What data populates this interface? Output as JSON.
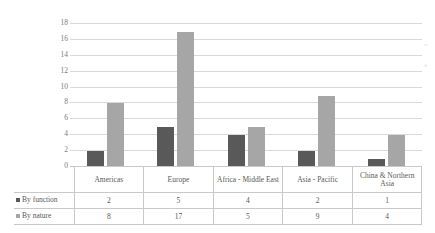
{
  "chart_data": {
    "type": "bar",
    "title": "",
    "xlabel": "",
    "ylabel": "",
    "ylim": [
      0,
      18
    ],
    "ytick_step": 2,
    "yticks": [
      "18",
      "16",
      "14",
      "12",
      "10",
      "8",
      "6",
      "4",
      "2",
      "0"
    ],
    "grid": true,
    "legend_position": "table-left",
    "categories": [
      "Americas",
      "Europe",
      "Africa - Middle East",
      "Asia - Pacific",
      "China & Northern Asia"
    ],
    "series": [
      {
        "name": "By function",
        "values": [
          2,
          5,
          4,
          2,
          1
        ],
        "color": "#595959"
      },
      {
        "name": "By nature",
        "values": [
          8,
          17,
          5,
          9,
          4
        ],
        "color": "#a6a6a6"
      }
    ]
  },
  "table": {
    "header": [
      "Americas",
      "Europe",
      "Africa - Middle East",
      "Asia - Pacific",
      "China & Northern Asia"
    ],
    "rows": [
      {
        "label": "By function",
        "values": [
          "2",
          "5",
          "4",
          "2",
          "1"
        ]
      },
      {
        "label": "By nature",
        "values": [
          "8",
          "17",
          "5",
          "9",
          "4"
        ]
      }
    ]
  },
  "artifacts": {
    "mark_top": "~",
    "mark_bottom": "«"
  }
}
